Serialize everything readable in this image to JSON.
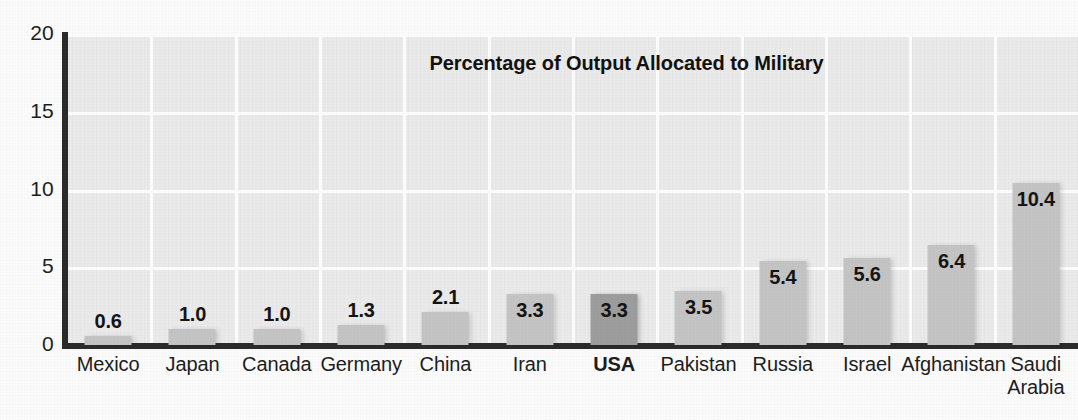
{
  "chart_data": {
    "type": "bar",
    "title": "Percentage of Output Allocated to Military",
    "xlabel": "",
    "ylabel": "",
    "ylim": [
      0,
      20
    ],
    "yticks": [
      "0",
      "5",
      "10",
      "15",
      "20"
    ],
    "grid": true,
    "legend": "none",
    "categories": [
      "Mexico",
      "Japan",
      "Canada",
      "Germany",
      "China",
      "Iran",
      "USA",
      "Pakistan",
      "Russia",
      "Israel",
      "Afghanistan",
      "Saudi\nArabia"
    ],
    "values": [
      0.6,
      1.0,
      1.0,
      1.3,
      2.1,
      3.3,
      3.3,
      3.5,
      5.4,
      5.6,
      6.4,
      10.4
    ],
    "value_labels": [
      "0.6",
      "1.0",
      "1.0",
      "1.3",
      "2.1",
      "3.3",
      "3.3",
      "3.5",
      "5.4",
      "5.6",
      "6.4",
      "10.4"
    ],
    "highlighted_category": "USA",
    "colors": {
      "bar": "#c4c4c4",
      "bar_highlight": "#9d9d9d",
      "plot_background": "#e9e9e9",
      "gridline": "#fdfdfd",
      "axis": "#2b2b2b",
      "text": "#1d1d1d",
      "page_background": "#fbfbfb"
    }
  }
}
